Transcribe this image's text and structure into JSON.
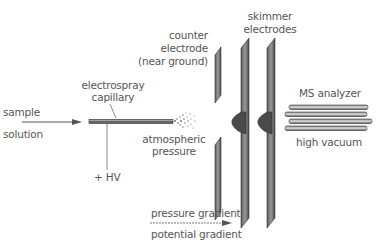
{
  "diagram": {
    "labels": {
      "sample_line1": "sample",
      "sample_line2": "solution",
      "capillary_line1": "electrospray",
      "capillary_line2": "capillary",
      "hv": "+ HV",
      "atmospheric_line1": "atmospheric",
      "atmospheric_line2": "pressure",
      "counter_line1": "counter",
      "counter_line2": "electrode",
      "counter_line3": "(near ground)",
      "skimmer_line1": "skimmer",
      "skimmer_line2": "electrodes",
      "ms_analyzer": "MS analyzer",
      "high_vacuum": "high vacuum",
      "pressure_gradient": "pressure gradient",
      "potential_gradient": "potential gradient"
    },
    "colors": {
      "line": "#555555",
      "electrode_fill": "#7a7a7a",
      "electrode_dark": "#3a3a3a",
      "text": "#555555"
    }
  }
}
